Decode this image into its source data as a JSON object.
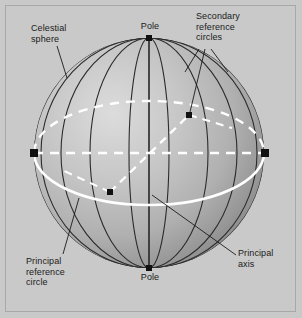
{
  "figure": {
    "name": "celestial-sphere-diagram",
    "background_color": "#c9c9c9",
    "frame_color": "#a8a8a8",
    "sphere": {
      "center_x": 149,
      "center_y": 153,
      "radius": 115,
      "ellipse_semi_minor": 52,
      "fill_light": "#d2d2d2",
      "fill_mid": "#b5b5b5",
      "fill_dark": "#8e8e8e",
      "meridian_color": "#2b2b2b",
      "reference_circle_color": "#ffffff",
      "marker_color": "#111111",
      "meridian_count": 9
    }
  },
  "labels": {
    "celestial_sphere": "Celestial\nsphere",
    "secondary_reference_circles": "Secondary\nreference\ncircles",
    "pole_north": "Pole",
    "pole_south": "Pole",
    "principal_reference_circle": "Principal\nreference\ncircle",
    "principal_axis": "Principal\naxis"
  },
  "markers": [
    {
      "name": "pole-north-marker",
      "x": 149,
      "y": 38,
      "size": 5
    },
    {
      "name": "pole-south-marker",
      "x": 149,
      "y": 268,
      "size": 5
    },
    {
      "name": "equator-left-marker",
      "x": 34,
      "y": 153,
      "size": 6
    },
    {
      "name": "equator-right-marker",
      "x": 265,
      "y": 153,
      "size": 6
    },
    {
      "name": "secondary-upper-marker",
      "x": 189,
      "y": 115,
      "size": 5
    },
    {
      "name": "secondary-lower-marker",
      "x": 110,
      "y": 192,
      "size": 5
    }
  ],
  "leader_lines": [
    {
      "name": "leader-celestial-sphere",
      "points": "57,46 67,76"
    },
    {
      "name": "leader-secondary-circles-a",
      "points": "199,47 186,70"
    },
    {
      "name": "leader-secondary-circles-b",
      "points": "206,47 190,113"
    },
    {
      "name": "leader-secondary-circles-c",
      "points": "213,47 226,70"
    },
    {
      "name": "leader-principal-circle",
      "points": "62,253 78,199"
    },
    {
      "name": "leader-principal-axis",
      "points": "236,256 152,194"
    }
  ]
}
